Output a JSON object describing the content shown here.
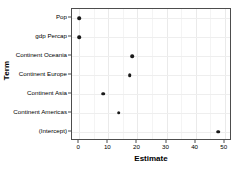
{
  "chart_data": {
    "type": "scatter",
    "title": "",
    "xlabel": "Estimate",
    "ylabel": "Term",
    "xlim": [
      -2.5,
      52.5
    ],
    "ylim": [
      0,
      7
    ],
    "grid": true,
    "legend": null,
    "xticks": [
      0,
      10,
      20,
      30,
      40,
      50
    ],
    "xtick_labels": [
      "0",
      "10",
      "20",
      "30",
      "40",
      "50"
    ],
    "xminor": [
      5,
      15,
      25,
      35,
      45
    ],
    "categories": [
      "Pop",
      "gdp Percap",
      "Continent Oceania",
      "Continent Europe",
      "Continent Asia",
      "Continent Americas",
      "(Intercept)"
    ],
    "values": [
      0.0,
      0.0,
      18.1,
      17.4,
      8.2,
      13.5,
      47.7
    ],
    "point_color": "#1a1a1a",
    "panel_border_color": "#4d4d4d",
    "grid_color": "#eaeaea",
    "background_color": "#ffffff"
  }
}
